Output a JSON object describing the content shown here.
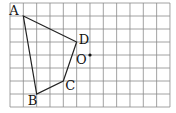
{
  "grid": {
    "x0": 10,
    "y0": 3,
    "cell_w": 13.33,
    "cell_h": 13,
    "cols": 12,
    "rows": 8,
    "line_color": "#8a8a8a"
  },
  "points": {
    "A": {
      "label": "A",
      "col": 1,
      "row": 1
    },
    "B": {
      "label": "B",
      "col": 2,
      "row": 7
    },
    "C": {
      "label": "C",
      "col": 4,
      "row": 6
    },
    "D": {
      "label": "D",
      "col": 5,
      "row": 3
    },
    "O": {
      "label": "O",
      "col": 6,
      "row": 4
    }
  },
  "polygon": [
    "A",
    "D",
    "C",
    "B"
  ],
  "labels": {
    "A": "A",
    "B": "B",
    "C": "C",
    "D": "D",
    "O": "O"
  }
}
